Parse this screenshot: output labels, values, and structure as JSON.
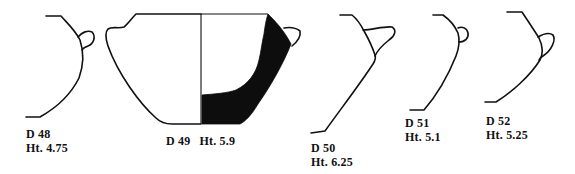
{
  "figure": {
    "type": "pottery-profile-plate",
    "vessels": [
      {
        "id": "D 48",
        "height": "Ht. 4.75"
      },
      {
        "id": "D 49",
        "height": "Ht. 5.9"
      },
      {
        "id": "D 50",
        "height": "Ht. 6.25"
      },
      {
        "id": "D 51",
        "height": "Ht. 5.1"
      },
      {
        "id": "D 52",
        "height": "Ht. 5.25"
      }
    ],
    "colors": {
      "ink": "#111111",
      "section_fill": "#0d0d0d",
      "background": "#ffffff"
    }
  }
}
